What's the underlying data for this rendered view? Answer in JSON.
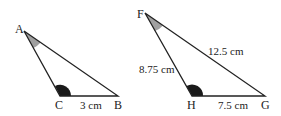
{
  "triangles": [
    {
      "name": "ABC",
      "vertices": {
        "A": {
          "label": "A",
          "x": 24,
          "y": 31
        },
        "C": {
          "label": "C",
          "x": 60,
          "y": 96
        },
        "B": {
          "label": "B",
          "x": 118,
          "y": 96
        }
      },
      "sides": {
        "CB": "3 cm"
      }
    },
    {
      "name": "FHG",
      "vertices": {
        "F": {
          "label": "F",
          "x": 145,
          "y": 13
        },
        "H": {
          "label": "H",
          "x": 192,
          "y": 96
        },
        "G": {
          "label": "G",
          "x": 265,
          "y": 96
        }
      },
      "sides": {
        "FG": "12.5 cm",
        "FH": "8.75 cm",
        "HG": "7.5 cm"
      }
    }
  ],
  "colors": {
    "line": "#222222",
    "acute_mark": "#a0a0a0",
    "obtuse_mark": "#1a1a1a"
  }
}
